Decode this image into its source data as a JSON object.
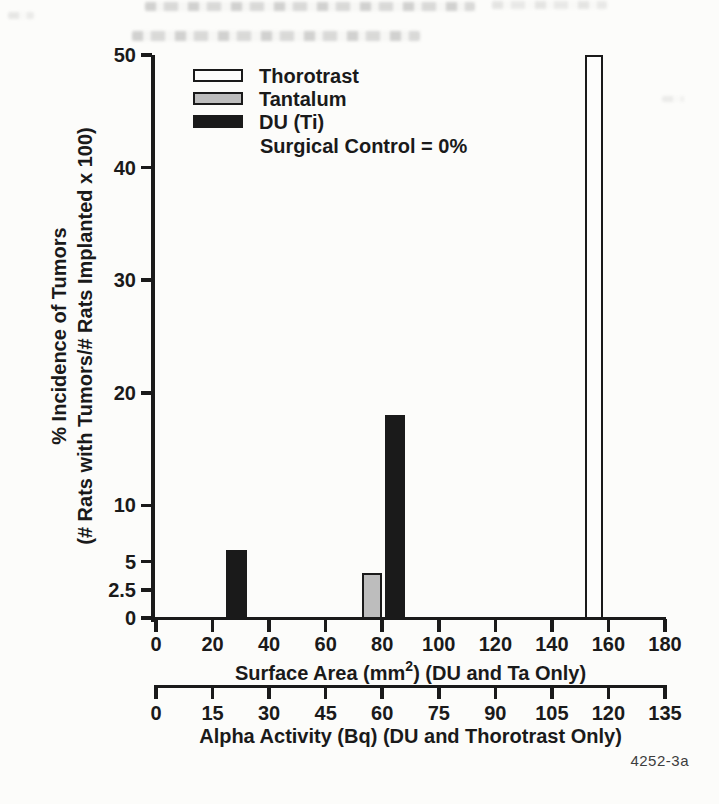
{
  "figure": {
    "figure_number": "4252-3a"
  },
  "legend": {
    "items": [
      {
        "label": "Thorotrast",
        "color": "#fdfdfc"
      },
      {
        "label": "Tantalum",
        "color": "#bdbdbd"
      },
      {
        "label": "DU (Ti)",
        "color": "#1a1a1a"
      }
    ],
    "note": "Surgical Control = 0%"
  },
  "chart_data": {
    "type": "bar",
    "title": "",
    "ylabel_lines": [
      "% Incidence of Tumors",
      "(# Rats with Tumors/# Rats Implanted x 100)"
    ],
    "xlabel_primary": {
      "prefix": "Surface Area (mm",
      "sup": "2",
      "suffix": ") (DU and Ta Only)"
    },
    "xlabel_secondary": "Alpha Activity (Bq) (DU and Thorotrast Only)",
    "y_axis": {
      "range": [
        0,
        50
      ],
      "ticks": [
        0,
        2.5,
        5,
        10,
        20,
        30,
        40,
        50
      ]
    },
    "x_axis_primary": {
      "label_unit": "mm2",
      "range": [
        0,
        180
      ],
      "ticks": [
        0,
        20,
        40,
        60,
        80,
        100,
        120,
        140,
        160,
        180
      ]
    },
    "x_axis_secondary": {
      "label_unit": "Bq",
      "range": [
        0,
        135
      ],
      "ticks": [
        0,
        15,
        30,
        45,
        60,
        75,
        90,
        105,
        120,
        135
      ]
    },
    "grid": false,
    "legend_position": "upper-left-inside",
    "annotations": [
      "Surgical Control = 0%"
    ],
    "series": [
      {
        "name": "Thorotrast",
        "fill": "#fdfdfc",
        "outline": "#1a1a1a",
        "bars": [
          {
            "x_center": 155,
            "x_width": 6.5,
            "value": 50
          }
        ]
      },
      {
        "name": "Tantalum",
        "fill": "#bdbdbd",
        "outline": "#1a1a1a",
        "bars": [
          {
            "x_center": 76.5,
            "x_width": 7,
            "value": 4
          }
        ]
      },
      {
        "name": "DU (Ti)",
        "fill": "#1a1a1a",
        "outline": "#1a1a1a",
        "bars": [
          {
            "x_center": 28.5,
            "x_width": 7.5,
            "value": 6
          },
          {
            "x_center": 84.5,
            "x_width": 7,
            "value": 18
          }
        ]
      }
    ]
  }
}
